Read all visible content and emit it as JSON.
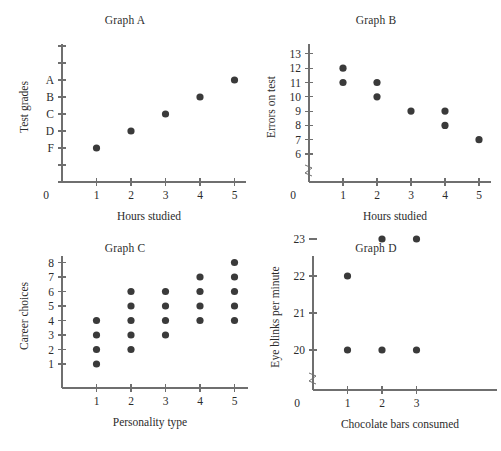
{
  "figure": {
    "panels": [
      "A",
      "B",
      "C",
      "D"
    ]
  },
  "chart_data": [
    {
      "type": "scatter",
      "title": "Graph A",
      "xlabel": "Hours studied",
      "ylabel": "Test grades",
      "x_ticks": [
        "1",
        "2",
        "3",
        "4",
        "5"
      ],
      "x_origin_label": "0",
      "y_ticks": [
        "A",
        "B",
        "C",
        "D",
        "F"
      ],
      "y_extra_ticks_top": 2,
      "y_extra_ticks_bottom": 2,
      "xlim": [
        0,
        6
      ],
      "ylim": [
        0,
        8
      ],
      "grid": false,
      "legend": "none",
      "axis_break": false,
      "points": [
        {
          "x": 1,
          "y": "F"
        },
        {
          "x": 2,
          "y": "D"
        },
        {
          "x": 3,
          "y": "C"
        },
        {
          "x": 4,
          "y": "B"
        },
        {
          "x": 5,
          "y": "A"
        }
      ]
    },
    {
      "type": "scatter",
      "title": "Graph B",
      "xlabel": "Hours studied",
      "ylabel": "Errors on test",
      "x_ticks": [
        "1",
        "2",
        "3",
        "4",
        "5"
      ],
      "x_origin_label": "0",
      "y_ticks": [
        "6",
        "7",
        "8",
        "9",
        "10",
        "11",
        "12",
        "13"
      ],
      "xlim": [
        0,
        6
      ],
      "ylim": [
        6,
        13
      ],
      "grid": false,
      "legend": "none",
      "axis_break": true,
      "points": [
        {
          "x": 1,
          "y": 12
        },
        {
          "x": 1,
          "y": 11
        },
        {
          "x": 2,
          "y": 11
        },
        {
          "x": 2,
          "y": 10
        },
        {
          "x": 3,
          "y": 9
        },
        {
          "x": 4,
          "y": 9
        },
        {
          "x": 4,
          "y": 8
        },
        {
          "x": 5,
          "y": 7
        }
      ]
    },
    {
      "type": "scatter",
      "title": "Graph C",
      "xlabel": "Personality type",
      "ylabel": "Career choices",
      "x_ticks": [
        "1",
        "2",
        "3",
        "4",
        "5"
      ],
      "x_origin_label": "",
      "y_ticks": [
        "1",
        "2",
        "3",
        "4",
        "5",
        "6",
        "7",
        "8"
      ],
      "xlim": [
        0,
        6
      ],
      "ylim": [
        0,
        9
      ],
      "grid": false,
      "legend": "none",
      "axis_break": false,
      "points": [
        {
          "x": 1,
          "y": 1
        },
        {
          "x": 1,
          "y": 2
        },
        {
          "x": 1,
          "y": 3
        },
        {
          "x": 1,
          "y": 4
        },
        {
          "x": 2,
          "y": 2
        },
        {
          "x": 2,
          "y": 3
        },
        {
          "x": 2,
          "y": 4
        },
        {
          "x": 2,
          "y": 5
        },
        {
          "x": 2,
          "y": 6
        },
        {
          "x": 3,
          "y": 3
        },
        {
          "x": 3,
          "y": 4
        },
        {
          "x": 3,
          "y": 5
        },
        {
          "x": 3,
          "y": 6
        },
        {
          "x": 4,
          "y": 4
        },
        {
          "x": 4,
          "y": 5
        },
        {
          "x": 4,
          "y": 6
        },
        {
          "x": 4,
          "y": 7
        },
        {
          "x": 5,
          "y": 4
        },
        {
          "x": 5,
          "y": 5
        },
        {
          "x": 5,
          "y": 6
        },
        {
          "x": 5,
          "y": 7
        },
        {
          "x": 5,
          "y": 8
        }
      ]
    },
    {
      "type": "scatter",
      "title": "Graph D",
      "xlabel": "Chocolate bars consumed",
      "ylabel": "Eye blinks per minute",
      "x_ticks": [
        "1",
        "2",
        "3"
      ],
      "x_origin_label": "0",
      "y_ticks": [
        "20",
        "21",
        "22",
        "23"
      ],
      "xlim": [
        0,
        4.6
      ],
      "ylim": [
        20,
        23
      ],
      "grid": false,
      "legend": "none",
      "axis_break": true,
      "points": [
        {
          "x": 1,
          "y": 22
        },
        {
          "x": 1,
          "y": 20
        },
        {
          "x": 2,
          "y": 23
        },
        {
          "x": 2,
          "y": 20
        },
        {
          "x": 3,
          "y": 23
        },
        {
          "x": 3,
          "y": 20
        }
      ]
    }
  ],
  "colors": {
    "dot": "#3a3a3a",
    "axis": "#6f6f6f",
    "text": "#2b2b2b",
    "background": "#ffffff"
  }
}
